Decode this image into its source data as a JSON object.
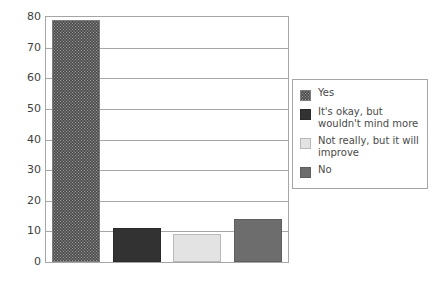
{
  "chart_data": {
    "type": "bar",
    "title": "",
    "subtitle": "",
    "xlabel": "",
    "ylabel": "",
    "ylim": [
      0,
      80
    ],
    "ytick_labels": [
      "80",
      "70",
      "60",
      "50",
      "40",
      "30",
      "20",
      "10",
      "0"
    ],
    "ytick_values": [
      80,
      70,
      60,
      50,
      40,
      30,
      20,
      10,
      0
    ],
    "grid": "horizontal",
    "legend_position": "right",
    "categories": [
      "Yes",
      "It's okay, but wouldn't mind more",
      "Not really, but it will improve",
      "No"
    ],
    "values": [
      79,
      11,
      9,
      14
    ],
    "series": [
      {
        "name": "Responses",
        "values": [
          79,
          11,
          9,
          14
        ]
      }
    ],
    "bar_styles": [
      "hatch",
      "dark",
      "light",
      "mid"
    ],
    "colors": {
      "hatch": "#9a9a9a",
      "dark": "#323232",
      "light": "#e3e3e3",
      "mid": "#6d6d6d",
      "grid": "#a6a6a6",
      "frame": "#a6a6a6",
      "text": "#3f3f3f",
      "background": "#ffffff"
    }
  },
  "legend": {
    "items": [
      {
        "label": "Yes",
        "style": "hatch"
      },
      {
        "label": "It's okay, but wouldn't mind more",
        "style": "dark"
      },
      {
        "label": "Not really, but it will improve",
        "style": "light"
      },
      {
        "label": "No",
        "style": "mid"
      }
    ]
  }
}
